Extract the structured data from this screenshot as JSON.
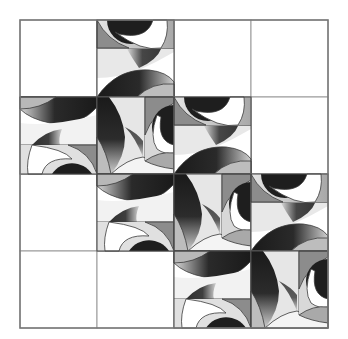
{
  "puzzle": {
    "rows": 4,
    "cols": 4,
    "origin": [
      20,
      20
    ],
    "cell_size": 77,
    "grid_color": "#9a9a9a",
    "border_color": "#777777",
    "cells": [
      {
        "row": 0,
        "col": 0,
        "tile": "empty"
      },
      {
        "row": 0,
        "col": 1,
        "tile": "A"
      },
      {
        "row": 0,
        "col": 2,
        "tile": "empty"
      },
      {
        "row": 0,
        "col": 3,
        "tile": "empty"
      },
      {
        "row": 1,
        "col": 0,
        "tile": "C"
      },
      {
        "row": 1,
        "col": 1,
        "tile": "B"
      },
      {
        "row": 1,
        "col": 2,
        "tile": "A"
      },
      {
        "row": 1,
        "col": 3,
        "tile": "empty"
      },
      {
        "row": 2,
        "col": 0,
        "tile": "empty"
      },
      {
        "row": 2,
        "col": 1,
        "tile": "C"
      },
      {
        "row": 2,
        "col": 2,
        "tile": "B"
      },
      {
        "row": 2,
        "col": 3,
        "tile": "A"
      },
      {
        "row": 3,
        "col": 0,
        "tile": "empty"
      },
      {
        "row": 3,
        "col": 1,
        "tile": "empty"
      },
      {
        "row": 3,
        "col": 2,
        "tile": "C"
      },
      {
        "row": 3,
        "col": 3,
        "tile": "B"
      }
    ],
    "palette": {
      "dark": "#1e1e1e",
      "mid": "#8c8c8c",
      "light": "#d6d6d6",
      "white": "#ffffff",
      "stroke": "#3a3a3a"
    }
  }
}
